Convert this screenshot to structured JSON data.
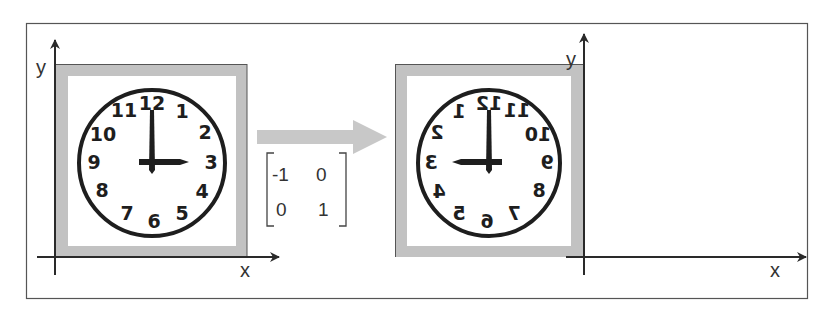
{
  "figure": {
    "left_panel": {
      "axis_y_label": "y",
      "axis_x_label": "x",
      "clock": {
        "numbers": [
          "12",
          "1",
          "2",
          "3",
          "4",
          "5",
          "6",
          "7",
          "8",
          "9",
          "10",
          "11"
        ],
        "time_shown": "3:00",
        "mirrored": false
      }
    },
    "transform": {
      "arrow": "right",
      "matrix": [
        [
          "-1",
          "0"
        ],
        [
          "0",
          "1"
        ]
      ],
      "m00": "-1",
      "m01": "0",
      "m10": "0",
      "m11": "1"
    },
    "right_panel": {
      "axis_y_label": "y",
      "axis_x_label": "x",
      "clock": {
        "numbers": [
          "12",
          "1",
          "2",
          "3",
          "4",
          "5",
          "6",
          "7",
          "8",
          "9",
          "10",
          "11"
        ],
        "time_shown": "9:00 (mirrored)",
        "mirrored": true
      }
    },
    "colors": {
      "frame_gray": "#c2c2c2",
      "arrow_gray": "#c8c8c8",
      "ink": "#222222",
      "border": "#555555"
    }
  }
}
